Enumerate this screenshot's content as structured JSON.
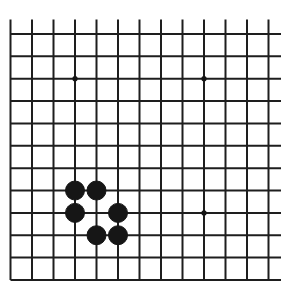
{
  "board": {
    "size": 19,
    "view": "bottom-left corner",
    "visible_columns": 13,
    "visible_rows": 12,
    "colors": {
      "background": "#ffffff",
      "line": "#1e1e1e",
      "black_stone": "#161616",
      "star_point": "#161616"
    },
    "geometry": {
      "x0": 10.5,
      "dx": 21.5,
      "y0": 34,
      "dy": 22.36,
      "line_width": 2,
      "vertical_line_top": 19.5,
      "vertical_line_bottom": 280,
      "horizontal_line_left": 10.5,
      "horizontal_line_right": 281,
      "stone_radius": 9.5,
      "star_radius": 2.6
    },
    "edges": {
      "left": true,
      "bottom": true,
      "top": false,
      "right": false
    },
    "star_points": [
      {
        "col": 3,
        "row": 2
      },
      {
        "col": 9,
        "row": 2
      },
      {
        "col": 9,
        "row": 8
      },
      {
        "col": 3,
        "row": 8
      }
    ],
    "stones": [
      {
        "color": "black",
        "col": 3,
        "row": 7
      },
      {
        "color": "black",
        "col": 4,
        "row": 7
      },
      {
        "color": "black",
        "col": 3,
        "row": 8
      },
      {
        "color": "black",
        "col": 5,
        "row": 8
      },
      {
        "color": "black",
        "col": 4,
        "row": 9
      },
      {
        "color": "black",
        "col": 5,
        "row": 9
      }
    ]
  }
}
